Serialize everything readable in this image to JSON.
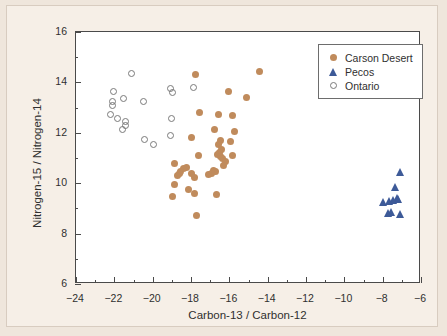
{
  "chart_data": {
    "type": "scatter",
    "title": "",
    "xlabel": "Carbon-13 / Carbon-12",
    "ylabel": "Nitrogen-15 / Nitrogen-14",
    "xlim": [
      -24,
      -6
    ],
    "ylim": [
      6,
      16
    ],
    "x_major_ticks": [
      -24,
      -22,
      -20,
      -18,
      -16,
      -14,
      -12,
      -10,
      -8,
      -6
    ],
    "x_major_ticklabels": [
      "−24",
      "−22",
      "−20",
      "−18",
      "−16",
      "−14",
      "−12",
      "−10",
      "−8",
      "−6"
    ],
    "x_minor_ticks": [
      -23,
      -21,
      -19,
      -17,
      -15,
      -13,
      -11,
      -9,
      -7
    ],
    "y_major_ticks": [
      6,
      8,
      10,
      12,
      14,
      16
    ],
    "y_major_ticklabels": [
      "6",
      "8",
      "10",
      "12",
      "14",
      "16"
    ],
    "y_minor_ticks": [
      7,
      9,
      11,
      13,
      15
    ],
    "grid": false,
    "legend_position": "top-right",
    "series": [
      {
        "name": "Carson Desert",
        "marker": "filled-circle",
        "color": "#c08b5c",
        "points": [
          [
            -17.75,
            14.3
          ],
          [
            -14.45,
            14.45
          ],
          [
            -16.05,
            13.62
          ],
          [
            -15.1,
            13.42
          ],
          [
            -17.55,
            12.82
          ],
          [
            -16.55,
            12.72
          ],
          [
            -15.85,
            12.68
          ],
          [
            -16.75,
            12.15
          ],
          [
            -15.75,
            12.05
          ],
          [
            -17.95,
            11.82
          ],
          [
            -16.45,
            11.7
          ],
          [
            -15.95,
            11.65
          ],
          [
            -16.55,
            11.52
          ],
          [
            -16.4,
            11.35
          ],
          [
            -16.5,
            11.2
          ],
          [
            -16.6,
            11.12
          ],
          [
            -16.45,
            11.05
          ],
          [
            -16.35,
            11.0
          ],
          [
            -15.85,
            11.08
          ],
          [
            -17.6,
            11.1
          ],
          [
            -16.2,
            10.85
          ],
          [
            -16.3,
            10.72
          ],
          [
            -18.85,
            10.8
          ],
          [
            -18.25,
            10.62
          ],
          [
            -18.4,
            10.58
          ],
          [
            -18.55,
            10.48
          ],
          [
            -18.6,
            10.4
          ],
          [
            -18.0,
            10.38
          ],
          [
            -17.8,
            10.22
          ],
          [
            -16.85,
            10.52
          ],
          [
            -16.7,
            10.45
          ],
          [
            -16.95,
            10.4
          ],
          [
            -17.1,
            10.35
          ],
          [
            -18.7,
            10.3
          ],
          [
            -18.85,
            9.95
          ],
          [
            -18.15,
            9.75
          ],
          [
            -17.8,
            9.6
          ],
          [
            -16.65,
            9.55
          ],
          [
            -18.95,
            9.48
          ],
          [
            -17.7,
            8.72
          ]
        ]
      },
      {
        "name": "Pecos",
        "marker": "filled-triangle",
        "color": "#3d5a98",
        "points": [
          [
            -7.05,
            10.45
          ],
          [
            -7.35,
            9.85
          ],
          [
            -7.25,
            9.42
          ],
          [
            -7.15,
            9.38
          ],
          [
            -7.45,
            9.35
          ],
          [
            -7.95,
            9.25
          ],
          [
            -7.65,
            9.3
          ],
          [
            -7.55,
            8.85
          ],
          [
            -7.7,
            8.82
          ],
          [
            -7.05,
            8.78
          ]
        ]
      },
      {
        "name": "Ontario",
        "marker": "open-circle",
        "color": "#7a7a7a",
        "points": [
          [
            -21.1,
            14.35
          ],
          [
            -22.05,
            13.62
          ],
          [
            -22.1,
            13.25
          ],
          [
            -22.1,
            13.1
          ],
          [
            -21.5,
            13.35
          ],
          [
            -20.5,
            13.25
          ],
          [
            -19.05,
            13.75
          ],
          [
            -18.95,
            13.6
          ],
          [
            -17.85,
            13.78
          ],
          [
            -22.2,
            12.72
          ],
          [
            -21.85,
            12.55
          ],
          [
            -21.4,
            12.45
          ],
          [
            -21.4,
            12.3
          ],
          [
            -21.6,
            12.15
          ],
          [
            -19.0,
            12.55
          ],
          [
            -20.45,
            11.75
          ],
          [
            -19.95,
            11.55
          ],
          [
            -19.05,
            11.88
          ]
        ]
      }
    ]
  },
  "legend": {
    "entries": [
      {
        "label": "Carson Desert",
        "marker": "filled-circle"
      },
      {
        "label": "Pecos",
        "marker": "filled-triangle"
      },
      {
        "label": "Ontario",
        "marker": "open-circle"
      }
    ]
  },
  "colors": {
    "carson_desert": "#c08b5c",
    "pecos": "#3d5a98",
    "ontario": "#7a7a7a",
    "background": "#efe6dc",
    "panel": "#f6efe7",
    "plot_background": "#ffffff",
    "axis": "#4a4a4a"
  }
}
